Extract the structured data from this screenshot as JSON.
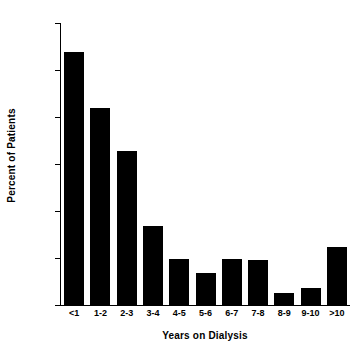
{
  "chart_data": {
    "type": "bar",
    "title": "",
    "subtitle": "",
    "xlabel": "Years on Dialysis",
    "ylabel": "Percent of Patients",
    "categories": [
      "<1",
      "1-2",
      "2-3",
      "3-4",
      "4-5",
      "5-6",
      "6-7",
      "7-8",
      "8-9",
      "9-10",
      ">10"
    ],
    "values": [
      26.9,
      21.0,
      16.4,
      8.4,
      4.9,
      3.4,
      4.9,
      4.8,
      1.3,
      1.8,
      6.2
    ],
    "ylim": [
      0,
      30
    ],
    "yticks": [
      0,
      5,
      10,
      15,
      20,
      25,
      30
    ],
    "ytick_labels": [
      "0",
      "5",
      "10",
      "15",
      "20",
      "25",
      "30"
    ],
    "xlim": [
      0,
      11
    ],
    "grid": false,
    "legend": null,
    "bar_color": "#000000",
    "axis_color": "#000000",
    "background_color": "#ffffff",
    "annotations": []
  }
}
